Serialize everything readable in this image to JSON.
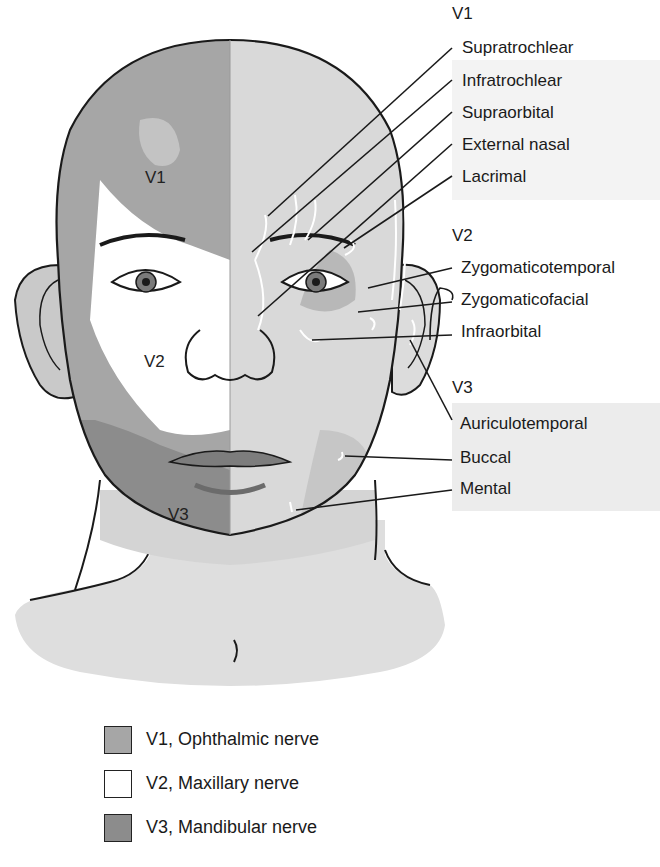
{
  "figure": {
    "type": "anatomical-diagram"
  },
  "face_zones": [
    {
      "id": "v1",
      "label": "V1"
    },
    {
      "id": "v2",
      "label": "V2"
    },
    {
      "id": "v3",
      "label": "V3"
    }
  ],
  "callouts": {
    "groups": [
      {
        "id": "v1",
        "title": "V1",
        "items": [
          "Supratrochlear",
          "Infratrochlear",
          "Supraorbital",
          "External nasal",
          "Lacrimal"
        ]
      },
      {
        "id": "v2",
        "title": "V2",
        "items": [
          "Zygomaticotemporal",
          "Zygomaticofacial",
          "Infraorbital"
        ]
      },
      {
        "id": "v3",
        "title": "V3",
        "items": [
          "Auriculotemporal",
          "Buccal",
          "Mental"
        ]
      }
    ]
  },
  "legend": {
    "items": [
      {
        "label": "V1, Ophthalmic nerve",
        "color": "#a6a6a6"
      },
      {
        "label": "V2, Maxillary nerve",
        "color": "#ffffff"
      },
      {
        "label": "V3, Mandibular nerve",
        "color": "#8c8c8c"
      }
    ]
  },
  "colors": {
    "v1_zone": "#a6a6a6",
    "v2_zone": "#ffffff",
    "v3_zone": "#8c8c8c",
    "right_skin": "#dcdcdc",
    "outline": "#1a1a1a",
    "nerve_branch": "#ffffff"
  }
}
